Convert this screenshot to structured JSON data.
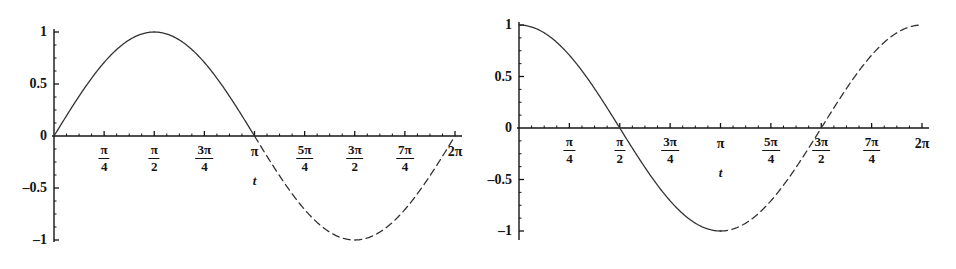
{
  "figure": {
    "background_color": "#ffffff",
    "line_color": "#333333",
    "axis_color": "#141414"
  },
  "panels": [
    {
      "id": "sine",
      "name": "sine-plot",
      "chart_data": {
        "type": "line",
        "title": "",
        "xlabel": "t",
        "ylabel": "",
        "xlim": [
          0,
          6.283185307179586
        ],
        "ylim": [
          -1,
          1
        ],
        "grid": false,
        "legend": "none",
        "x_tick_labels": [
          "",
          "π/4",
          "π/2",
          "3π/4",
          "π",
          "5π/4",
          "3π/2",
          "7π/4",
          "2π"
        ],
        "x_tick_values": [
          0,
          0.7853981634,
          1.5707963268,
          2.3561944902,
          3.1415926536,
          3.926990817,
          4.7123889804,
          5.4977871438,
          6.2831853072
        ],
        "y_tick_labels": [
          "1",
          "0.5",
          "0",
          "-0.5",
          "-1"
        ],
        "y_tick_values": [
          1,
          0.5,
          0,
          -0.5,
          -1
        ],
        "series": [
          {
            "name": "sin(t) solid segment",
            "style": "solid",
            "function": "sin",
            "x_start": 0,
            "x_end": 3.1415926536,
            "values": [
              0,
              0.3827,
              0.7071,
              0.9239,
              1,
              0.9239,
              0.7071,
              0.3827,
              0
            ]
          },
          {
            "name": "sin(t) dashed segment",
            "style": "dashed",
            "function": "sin",
            "x_start": 3.1415926536,
            "x_end": 6.2831853072,
            "values": [
              0,
              -0.3827,
              -0.7071,
              -0.9239,
              -1,
              -0.9239,
              -0.7071,
              -0.3827,
              0
            ]
          }
        ]
      },
      "y_labels": [
        {
          "text": "1",
          "value": 1
        },
        {
          "text": "0.5",
          "value": 0.5
        },
        {
          "text": "0",
          "value": 0
        },
        {
          "text": "–0.5",
          "value": -0.5
        },
        {
          "text": "–1",
          "value": -1
        }
      ],
      "x_labels": [
        {
          "kind": "frac",
          "num": "π",
          "den": "4",
          "value": 0.7853981634
        },
        {
          "kind": "frac",
          "num": "π",
          "den": "2",
          "value": 1.5707963268
        },
        {
          "kind": "frac",
          "num": "3π",
          "den": "4",
          "value": 2.3561944902
        },
        {
          "kind": "simple",
          "text": "π",
          "value": 3.1415926536
        },
        {
          "kind": "frac",
          "num": "5π",
          "den": "4",
          "value": 3.926990817
        },
        {
          "kind": "frac",
          "num": "3π",
          "den": "2",
          "value": 4.7123889804
        },
        {
          "kind": "frac",
          "num": "7π",
          "den": "4",
          "value": 5.4977871438
        },
        {
          "kind": "simple",
          "text": "2π",
          "value": 6.2831853072
        }
      ],
      "variable_label": {
        "text": "t",
        "value": 3.1415926536
      }
    },
    {
      "id": "cosine",
      "name": "cosine-plot",
      "chart_data": {
        "type": "line",
        "title": "",
        "xlabel": "t",
        "ylabel": "",
        "xlim": [
          0,
          6.283185307179586
        ],
        "ylim": [
          -1,
          1
        ],
        "grid": false,
        "legend": "none",
        "x_tick_labels": [
          "",
          "π/4",
          "π/2",
          "3π/4",
          "π",
          "5π/4",
          "3π/2",
          "7π/4",
          "2π"
        ],
        "x_tick_values": [
          0,
          0.7853981634,
          1.5707963268,
          2.3561944902,
          3.1415926536,
          3.926990817,
          4.7123889804,
          5.4977871438,
          6.2831853072
        ],
        "y_tick_labels": [
          "1",
          "0.5",
          "0",
          "-0.5",
          "-1"
        ],
        "y_tick_values": [
          1,
          0.5,
          0,
          -0.5,
          -1
        ],
        "series": [
          {
            "name": "cos(t) solid segment",
            "style": "solid",
            "function": "cos",
            "x_start": 0,
            "x_end": 3.1415926536,
            "values": [
              1,
              0.9239,
              0.7071,
              0.3827,
              0,
              -0.3827,
              -0.7071,
              -0.9239,
              -1
            ]
          },
          {
            "name": "cos(t) dashed segment",
            "style": "dashed",
            "function": "cos",
            "x_start": 3.1415926536,
            "x_end": 6.2831853072,
            "values": [
              -1,
              -0.9239,
              -0.7071,
              -0.3827,
              0,
              0.3827,
              0.7071,
              0.9239,
              1
            ]
          }
        ]
      },
      "y_labels": [
        {
          "text": "1",
          "value": 1
        },
        {
          "text": "0.5",
          "value": 0.5
        },
        {
          "text": "0",
          "value": 0
        },
        {
          "text": "–0.5",
          "value": -0.5
        },
        {
          "text": "–1",
          "value": -1
        }
      ],
      "x_labels": [
        {
          "kind": "frac",
          "num": "π",
          "den": "4",
          "value": 0.7853981634
        },
        {
          "kind": "frac",
          "num": "π",
          "den": "2",
          "value": 1.5707963268
        },
        {
          "kind": "frac",
          "num": "3π",
          "den": "4",
          "value": 2.3561944902
        },
        {
          "kind": "simple",
          "text": "π",
          "value": 3.1415926536
        },
        {
          "kind": "frac",
          "num": "5π",
          "den": "4",
          "value": 3.926990817
        },
        {
          "kind": "frac",
          "num": "3π",
          "den": "2",
          "value": 4.7123889804
        },
        {
          "kind": "frac",
          "num": "7π",
          "den": "4",
          "value": 5.4977871438
        },
        {
          "kind": "simple",
          "text": "2π",
          "value": 6.2831853072
        }
      ],
      "variable_label": {
        "text": "t",
        "value": 3.1415926536
      }
    }
  ]
}
